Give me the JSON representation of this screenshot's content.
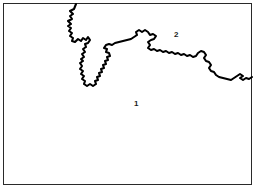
{
  "figure": {
    "type": "line-diagram",
    "width": 259,
    "height": 193,
    "background_color": "#ffffff",
    "frame": {
      "name": "frame-box",
      "stroke_color": "#2a2a2a",
      "stroke_width": 1,
      "x": 3,
      "y": 3,
      "width": 249,
      "height": 182
    },
    "boundary": {
      "name": "irregular-boundary-line",
      "stroke_color": "#000000",
      "stroke_width": 2.1,
      "fill": "none",
      "enters_at": "top-edge",
      "exits_at": "right-edge",
      "path": "M 76 4 L 74 9 L 70 11 L 73 14 L 70 16 L 72 19 L 68 21 L 71 24 L 68 26 L 71 28 L 69 31 L 72 33 L 70 36 L 73 38 L 72 41 L 75 42 L 78 39 L 81 41 L 83 38 L 86 40 L 88 37 L 90 40 L 88 43 L 85 44 L 86 47 L 83 49 L 85 52 L 82 54 L 84 57 L 81 59 L 83 61 L 80 63 L 82 66 L 80 69 L 83 71 L 81 74 L 84 76 L 82 79 L 85 81 L 84 84 L 87 86 L 90 84 L 93 86 L 96 84 L 95 81 L 98 80 L 97 77 L 100 76 L 99 73 L 102 72 L 101 69 L 104 68 L 103 65 L 106 64 L 105 61 L 108 60 L 107 57 L 110 56 L 109 53 L 106 52 L 107 49 L 104 48 L 106 45 L 109 44 L 112 45 L 115 43 L 119 42 L 123 41 L 127 40 L 131 39 L 134 37 L 137 35 L 136 32 L 139 30 L 142 32 L 145 30 L 148 32 L 150 35 L 153 34 L 156 36 L 154 39 L 151 40 L 148 42 L 150 45 L 148 48 L 151 50 L 154 49 L 157 51 L 160 50 L 163 52 L 166 51 L 169 53 L 172 52 L 175 54 L 178 53 L 181 55 L 184 54 L 187 56 L 190 55 L 193 57 L 196 56 L 198 53 L 201 51 L 204 52 L 206 55 L 204 58 L 206 61 L 209 62 L 211 65 L 209 68 L 211 71 L 214 72 L 216 75 L 219 77 L 223 78 L 227 79 L 231 80 L 234 78 L 237 76 L 240 74 L 243 76 L 240 78 L 243 80 L 246 78 L 249 79 L 252 77"
    },
    "labels": [
      {
        "name": "region-label-1",
        "text": "1",
        "x": 134,
        "y": 100
      },
      {
        "name": "region-label-2",
        "text": "2",
        "x": 174,
        "y": 31
      }
    ]
  }
}
